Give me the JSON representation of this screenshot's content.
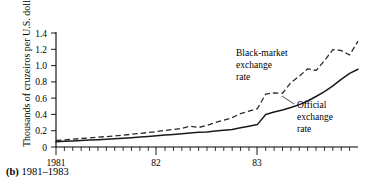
{
  "figure": {
    "caption_marker": "(b)",
    "caption_text": " 1981–1983"
  },
  "chart_data": {
    "type": "line",
    "title": "",
    "xlabel": "",
    "ylabel": "Thousands of cruzeiros per U.S. dollar",
    "ylim": [
      0,
      1.45
    ],
    "yticks": [
      0,
      0.2,
      0.4,
      0.6,
      0.8,
      1.0,
      1.2,
      1.4
    ],
    "ytick_labels": [
      "0",
      "0.2",
      "0.4",
      "0.6",
      "0.8",
      "1.0",
      "1.2",
      "1.4"
    ],
    "xlim": [
      1981.0,
      1984.0
    ],
    "xticks": [
      1981,
      1982,
      1983
    ],
    "xtick_labels": [
      "1981",
      "82",
      "83"
    ],
    "x_minor_tick_interval_months": 1,
    "grid": false,
    "legend_position": "inline-annotations",
    "annotations": [
      {
        "name": "black-market",
        "lines": [
          "Black-market",
          "exchange",
          "rate"
        ],
        "x": 1982.62,
        "y": 1.18
      },
      {
        "name": "official",
        "lines": [
          "Official",
          "exchange",
          "rate"
        ],
        "x": 1983.38,
        "y": 0.52
      }
    ],
    "x": [
      1981.0,
      1981.083,
      1981.167,
      1981.25,
      1981.333,
      1981.417,
      1981.5,
      1981.583,
      1981.667,
      1981.75,
      1981.833,
      1981.917,
      1982.0,
      1982.083,
      1982.167,
      1982.25,
      1982.333,
      1982.417,
      1982.5,
      1982.583,
      1982.667,
      1982.75,
      1982.833,
      1982.917,
      1983.0,
      1983.083,
      1983.167,
      1983.25,
      1983.333,
      1983.417,
      1983.5,
      1983.583,
      1983.667,
      1983.75,
      1983.833,
      1983.917,
      1984.0
    ],
    "series": [
      {
        "name": "Official exchange rate",
        "style": "solid",
        "values": [
          0.065,
          0.07,
          0.075,
          0.08,
          0.085,
          0.09,
          0.096,
          0.102,
          0.108,
          0.115,
          0.122,
          0.13,
          0.138,
          0.146,
          0.155,
          0.163,
          0.172,
          0.18,
          0.185,
          0.195,
          0.205,
          0.215,
          0.235,
          0.255,
          0.275,
          0.4,
          0.43,
          0.455,
          0.485,
          0.52,
          0.565,
          0.62,
          0.68,
          0.75,
          0.83,
          0.905,
          0.955
        ]
      },
      {
        "name": "Black-market exchange rate",
        "style": "dashed",
        "values": [
          0.08,
          0.088,
          0.096,
          0.104,
          0.112,
          0.12,
          0.128,
          0.137,
          0.146,
          0.156,
          0.167,
          0.178,
          0.19,
          0.203,
          0.216,
          0.23,
          0.255,
          0.24,
          0.265,
          0.3,
          0.33,
          0.36,
          0.41,
          0.44,
          0.47,
          0.65,
          0.665,
          0.66,
          0.79,
          0.87,
          0.96,
          0.94,
          1.06,
          1.195,
          1.185,
          1.13,
          1.3
        ]
      }
    ]
  }
}
